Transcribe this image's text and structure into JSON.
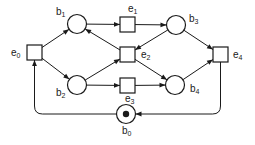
{
  "diagram": {
    "type": "petri-net",
    "colors": {
      "stroke": "#1a1a1a",
      "background": "#ffffff"
    },
    "places": [
      {
        "id": "b0",
        "base": "b",
        "sub": "0",
        "cx": 126,
        "cy": 114,
        "token": true
      },
      {
        "id": "b1",
        "base": "b",
        "sub": "1",
        "cx": 77,
        "cy": 24,
        "token": false
      },
      {
        "id": "b2",
        "base": "b",
        "sub": "2",
        "cx": 77,
        "cy": 85,
        "token": false
      },
      {
        "id": "b3",
        "base": "b",
        "sub": "3",
        "cx": 176,
        "cy": 25,
        "token": false
      },
      {
        "id": "b4",
        "base": "b",
        "sub": "4",
        "cx": 175,
        "cy": 85,
        "token": false
      }
    ],
    "transitions": [
      {
        "id": "e0",
        "base": "e",
        "sub": "0",
        "x": 27,
        "y": 45
      },
      {
        "id": "e1",
        "base": "e",
        "sub": "1",
        "x": 120,
        "y": 17
      },
      {
        "id": "e2",
        "base": "e",
        "sub": "2",
        "x": 120,
        "y": 47
      },
      {
        "id": "e3",
        "base": "e",
        "sub": "3",
        "x": 120,
        "y": 78
      },
      {
        "id": "e4",
        "base": "e",
        "sub": "4",
        "x": 213,
        "y": 47
      }
    ],
    "arcs": [
      {
        "from": "e0",
        "to": "b1"
      },
      {
        "from": "e0",
        "to": "b2"
      },
      {
        "from": "b1",
        "to": "e1"
      },
      {
        "from": "e1",
        "to": "b3"
      },
      {
        "from": "b3",
        "to": "e2"
      },
      {
        "from": "e2",
        "to": "b1"
      },
      {
        "from": "b2",
        "to": "e2"
      },
      {
        "from": "e2",
        "to": "b4"
      },
      {
        "from": "b2",
        "to": "e3"
      },
      {
        "from": "e3",
        "to": "b4"
      },
      {
        "from": "b3",
        "to": "e4"
      },
      {
        "from": "b4",
        "to": "e4"
      },
      {
        "from": "e4",
        "to": "b0"
      },
      {
        "from": "b0",
        "to": "e0"
      }
    ]
  }
}
